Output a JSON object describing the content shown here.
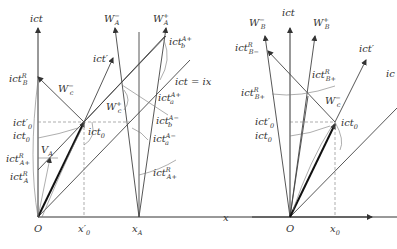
{
  "left_diagram": {
    "labels": {
      "ict": "ict",
      "W_A_minus": "W",
      "W_A_minus_sub": "A",
      "W_A_minus_sup": "−",
      "W_A_plus": "W",
      "W_A_plus_sub": "A",
      "W_A_plus_sup": "+",
      "ict_b_Aplus": "ict",
      "ict_b_Aplus_sub": "b",
      "ict_b_Aplus_sup": "A+",
      "ict_prime": "ict′",
      "ict_B_R": "ict",
      "ict_B_R_sub": "B",
      "ict_B_R_sup": "R",
      "W_c_minus": "W",
      "W_c_minus_sub": "c",
      "W_c_minus_sup": "−",
      "ict_eq_ix": "ict = ix",
      "ict_a_Aplus": "ict",
      "ict_a_Aplus_sub": "a",
      "ict_a_Aplus_sup": "A+",
      "W_c_plus": "W",
      "W_c_plus_sub": "c",
      "W_c_plus_sup": "+",
      "ict_b_Aminus": "ict",
      "ict_b_Aminus_sub": "b",
      "ict_b_Aminus_sup": "A−",
      "ict0_prime": "ict′",
      "ict0_prime_sub": "0",
      "ict0_a": "ict",
      "ict0_a_sub": "0",
      "ict0_b": "ict",
      "ict0_b_sub": "0",
      "ict_a_Aminus": "ict",
      "ict_a_Aminus_sub": "a",
      "ict_a_Aminus_sup": "A−",
      "V_A": "V",
      "V_A_sub": "A",
      "ict_Aplus_R": "ict",
      "ict_Aplus_R_sub": "A+",
      "ict_Aplus_R_sup": "R",
      "ict_A_R": "ict",
      "ict_A_R_sub": "A",
      "ict_A_R_sup": "R",
      "ict_Aplus_R_right": "ict",
      "ict_Aplus_R_right_sub": "A+",
      "ict_Aplus_R_right_sup": "R",
      "origin": "O",
      "x0_prime": "x′",
      "x0_prime_sub": "0",
      "x_A": "x",
      "x_A_sub": "A",
      "x_axis": "x"
    }
  },
  "right_diagram": {
    "labels": {
      "ict": "ict",
      "W_B_minus": "W",
      "W_B_minus_sub": "B",
      "W_B_minus_sup": "−",
      "W_B_plus": "W",
      "W_B_plus_sub": "B",
      "W_B_plus_sup": "+",
      "ict_Bminus_R": "ict",
      "ict_Bminus_R_sub": "B−",
      "ict_Bminus_R_sup": "R",
      "ict_prime": "ict′",
      "ic_cut": "ic",
      "ict_Bplus_R_a": "ict",
      "ict_Bplus_R_a_sub": "B+",
      "ict_Bplus_R_a_sup": "R",
      "ict_Bplus_R_b": "ict",
      "ict_Bplus_R_b_sub": "B+",
      "ict_Bplus_R_b_sup": "R",
      "W_c_minus": "W",
      "W_c_minus_sub": "c",
      "W_c_minus_sup": "−",
      "ict0_prime": "ict′",
      "ict0_prime_sub": "0",
      "ict0_a": "ict",
      "ict0_a_sub": "0",
      "ict0_b": "ict",
      "ict0_b_sub": "0",
      "origin": "O",
      "x0": "x",
      "x0_sub": "0"
    }
  }
}
